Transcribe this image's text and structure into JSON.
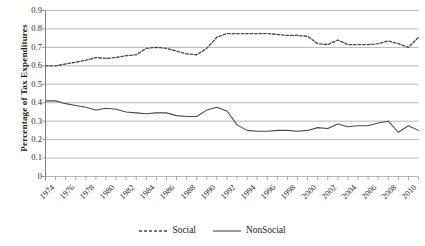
{
  "chart_data": {
    "type": "line",
    "title": "",
    "xlabel": "",
    "ylabel": "Percentage of Tax Expenditures",
    "ylim": [
      0,
      0.9
    ],
    "xlim": [
      1974,
      2011
    ],
    "grid": "horizontal",
    "legend_position": "bottom-center",
    "ytick_labels": [
      "0.9",
      "0.8",
      "0.7",
      "0.6",
      "0.5",
      "0.4",
      "0.3",
      "0.2",
      "0.1",
      "0"
    ],
    "ytick_values": [
      0.9,
      0.8,
      0.7,
      0.6,
      0.5,
      0.4,
      0.3,
      0.2,
      0.1,
      0
    ],
    "xtick_labels": [
      "1974",
      "1976",
      "1978",
      "1980",
      "1982",
      "1984",
      "1986",
      "1988",
      "1990",
      "1992",
      "1994",
      "1996",
      "1998",
      "2000",
      "2002",
      "2004",
      "2006",
      "2008",
      "2010"
    ],
    "x": [
      1974,
      1975,
      1976,
      1977,
      1978,
      1979,
      1980,
      1981,
      1982,
      1983,
      1984,
      1985,
      1986,
      1987,
      1988,
      1989,
      1990,
      1991,
      1992,
      1993,
      1994,
      1995,
      1996,
      1997,
      1998,
      1999,
      2000,
      2001,
      2002,
      2003,
      2004,
      2005,
      2006,
      2007,
      2008,
      2009,
      2010,
      2011
    ],
    "series": [
      {
        "name": "Social",
        "style": "dashed",
        "color": "#4a4a4a",
        "values": [
          0.6,
          0.6,
          0.61,
          0.62,
          0.63,
          0.645,
          0.64,
          0.645,
          0.655,
          0.66,
          0.695,
          0.7,
          0.695,
          0.68,
          0.665,
          0.66,
          0.695,
          0.755,
          0.775,
          0.775,
          0.775,
          0.775,
          0.775,
          0.77,
          0.765,
          0.765,
          0.76,
          0.72,
          0.715,
          0.74,
          0.715,
          0.715,
          0.715,
          0.72,
          0.735,
          0.72,
          0.7,
          0.755
        ]
      },
      {
        "name": "NonSocial",
        "style": "solid",
        "color": "#4a4a4a",
        "values": [
          0.41,
          0.41,
          0.395,
          0.385,
          0.375,
          0.36,
          0.37,
          0.365,
          0.35,
          0.345,
          0.34,
          0.345,
          0.345,
          0.33,
          0.325,
          0.325,
          0.36,
          0.375,
          0.355,
          0.28,
          0.25,
          0.245,
          0.245,
          0.25,
          0.25,
          0.245,
          0.25,
          0.265,
          0.26,
          0.285,
          0.27,
          0.275,
          0.275,
          0.29,
          0.3,
          0.24,
          0.275,
          0.25
        ]
      }
    ]
  },
  "legend": {
    "entries": [
      {
        "label": "Social"
      },
      {
        "label": "NonSocial"
      }
    ]
  },
  "colors": {
    "axis": "#808080",
    "grid": "#9a9a9a",
    "line": "#4a4a4a",
    "text": "#1a1a1a",
    "background": "#ffffff"
  }
}
